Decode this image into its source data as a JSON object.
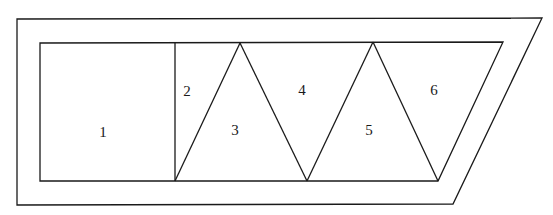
{
  "diagram": {
    "outer_shape": {
      "points": [
        [
          17,
          19
        ],
        [
          542,
          18
        ],
        [
          453,
          204
        ],
        [
          17,
          205
        ]
      ]
    },
    "inner_shape": {
      "points": [
        [
          40,
          43
        ],
        [
          503,
          42
        ],
        [
          438,
          181
        ],
        [
          40,
          181
        ]
      ]
    },
    "regions": [
      {
        "id": "1",
        "label": "1",
        "x": 103,
        "y": 134
      },
      {
        "id": "2",
        "label": "2",
        "x": 187,
        "y": 93
      },
      {
        "id": "3",
        "label": "3",
        "x": 235,
        "y": 132
      },
      {
        "id": "4",
        "label": "4",
        "x": 302,
        "y": 92
      },
      {
        "id": "5",
        "label": "5",
        "x": 369,
        "y": 132
      },
      {
        "id": "6",
        "label": "6",
        "x": 434,
        "y": 92
      }
    ],
    "lines": [
      {
        "name": "square-divider",
        "x1": 175,
        "y1": 43,
        "x2": 175,
        "y2": 181
      },
      {
        "name": "diag-1",
        "x1": 175,
        "y1": 181,
        "x2": 240,
        "y2": 43
      },
      {
        "name": "diag-2",
        "x1": 240,
        "y1": 43,
        "x2": 307,
        "y2": 181
      },
      {
        "name": "diag-3",
        "x1": 307,
        "y1": 181,
        "x2": 373,
        "y2": 42
      },
      {
        "name": "diag-4",
        "x1": 373,
        "y1": 42,
        "x2": 438,
        "y2": 181
      }
    ]
  }
}
